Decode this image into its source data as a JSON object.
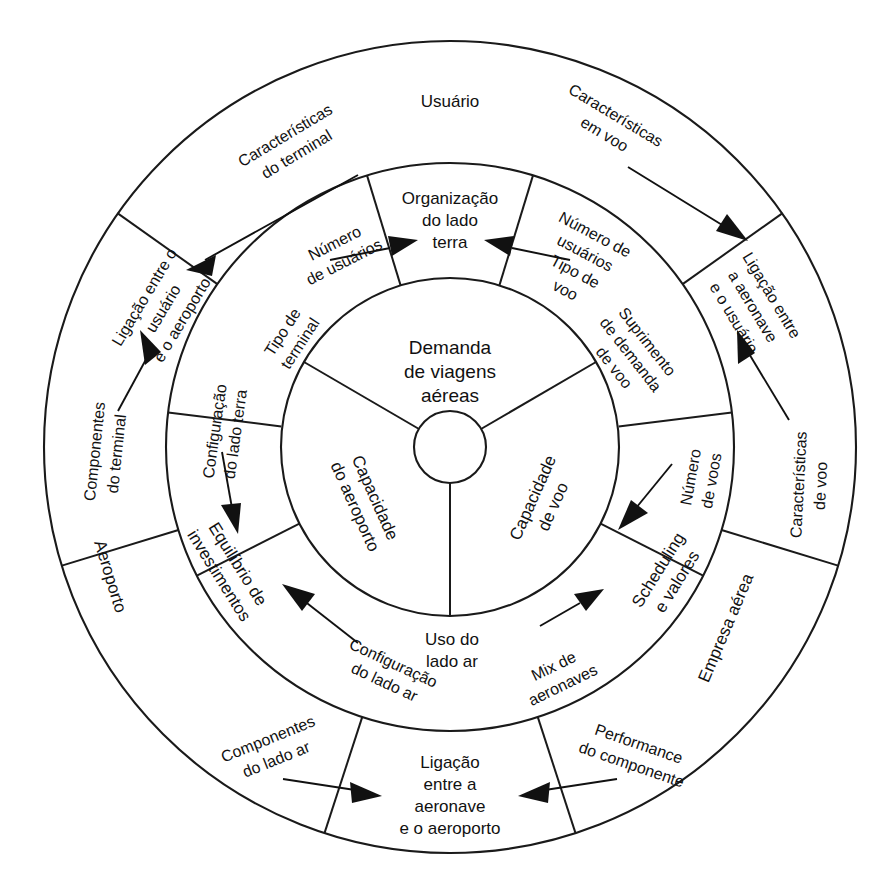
{
  "diagram": {
    "title_center": "Demanda de viagens aéreas",
    "center": {
      "line1": "Demanda",
      "line2": "de viagens",
      "line3": "aéreas"
    },
    "inner_ring": {
      "name": "inner-ring",
      "sectors": [
        {
          "id": "capacidade-do-aeroporto",
          "line1": "Capacidade",
          "line2": "do aeroporto"
        },
        {
          "id": "capacidade-de-voo",
          "line1": "Capacidade",
          "line2": "de voo"
        }
      ]
    },
    "middle_ring": {
      "name": "middle-ring",
      "sectors": [
        {
          "id": "organizacao-do-lado-terra",
          "line1": "Organização",
          "line2": "do lado",
          "line3": "terra"
        },
        {
          "id": "equilibrio-de-investimentos",
          "line1": "Equilíbrio de",
          "line2": "investimentos"
        },
        {
          "id": "scheduling-e-valores",
          "line1": "Scheduling",
          "line2": "e valores"
        }
      ],
      "connectors": [
        {
          "id": "numero-de-usuarios",
          "line1": "Número",
          "line2": "de usuários"
        },
        {
          "id": "numero-de-usuarios-tipo-de-voo",
          "line1": "Número de",
          "line2": "usuários",
          "line3": "Tipo de",
          "line4": "voo"
        },
        {
          "id": "suprimento-de-demanda-de-voo",
          "line1": "Suprimento",
          "line2": "de demanda",
          "line3": "de voo"
        },
        {
          "id": "numero-de-voos",
          "line1": "Número",
          "line2": "de voos"
        },
        {
          "id": "mix-de-aeronaves",
          "line1": "Mix de",
          "line2": "aeronaves"
        },
        {
          "id": "configuracao-do-lado-ar",
          "line1": "Configuração",
          "line2": "do lado ar"
        },
        {
          "id": "configuracao-do-lado-terra",
          "line1": "Configuração",
          "line2": "do lado terra"
        },
        {
          "id": "tipo-de-terminal",
          "line1": "Tipo de",
          "line2": "terminal"
        },
        {
          "id": "uso-do-lado-ar",
          "line1": "Uso do",
          "line2": "lado ar"
        }
      ]
    },
    "outer_ring": {
      "name": "outer-ring",
      "sectors": [
        {
          "id": "usuario",
          "label": "Usuário"
        },
        {
          "id": "aeroporto",
          "label": "Aeroporto"
        },
        {
          "id": "empresa-aerea",
          "label": "Empresa aérea"
        },
        {
          "id": "ligacao-entre-o-usuario-e-o-aeroporto",
          "line1": "Ligação entre o",
          "line2": "usuário",
          "line3": "e o aeroporto"
        },
        {
          "id": "ligacao-entre-a-aeronave-e-o-usuario",
          "line1": "Ligação entre",
          "line2": "a aeronave",
          "line3": "e o usuário"
        },
        {
          "id": "ligacao-entre-a-aeronave-e-o-aeroporto",
          "line1": "Ligação",
          "line2": "entre a",
          "line3": "aeronave",
          "line4": "e o aeroporto"
        }
      ],
      "connectors": [
        {
          "id": "caracteristicas-do-terminal",
          "line1": "Características",
          "line2": "do terminal"
        },
        {
          "id": "caracteristicas-em-voo",
          "line1": "Características",
          "line2": "em voo"
        },
        {
          "id": "caracteristicas-de-voo",
          "line1": "Características",
          "line2": "de voo"
        },
        {
          "id": "componentes-do-terminal",
          "line1": "Componentes",
          "line2": "do terminal"
        },
        {
          "id": "componentes-do-lado-ar",
          "line1": "Componentes",
          "line2": "do lado ar"
        },
        {
          "id": "performance-do-componente",
          "line1": "Performance",
          "line2": "do componente"
        }
      ]
    },
    "colors": {
      "stroke": "#111111",
      "background": "#ffffff"
    }
  }
}
